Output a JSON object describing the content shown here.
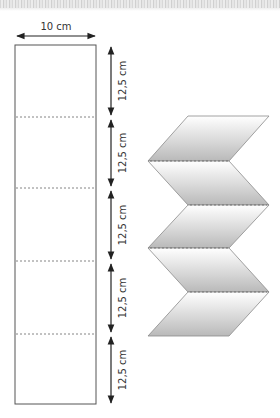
{
  "diagram": {
    "width_label": "10 cm",
    "segment_labels": [
      "12,5 cm",
      "12,5 cm",
      "12,5 cm",
      "12,5 cm",
      "12,5 cm"
    ],
    "segment_count": 5,
    "colors": {
      "outline": "#555555",
      "arrow": "#222222",
      "text": "#333333",
      "fold_line": "#666666",
      "zigzag_edge": "#888888",
      "zigzag_light": "#ffffff",
      "zigzag_dark": "#bdbdbd"
    }
  }
}
